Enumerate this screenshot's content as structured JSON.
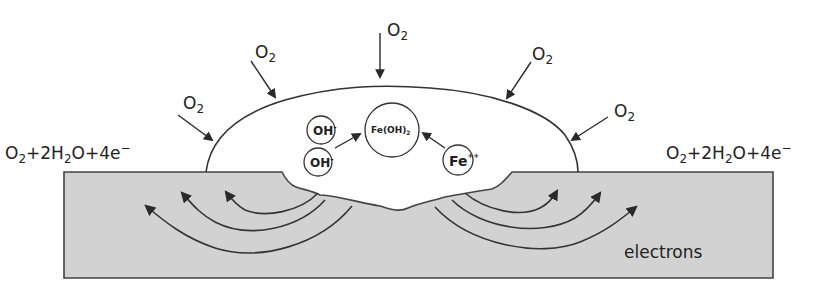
{
  "diagram": {
    "type": "pitting-corrosion-droplet",
    "colors": {
      "background": "#ffffff",
      "metal_fill": "#d2d2d2",
      "stroke": "#333333",
      "text": "#222222"
    },
    "oxygen_labels": [
      {
        "base": "O",
        "sub": "2",
        "x": 183,
        "y": 109
      },
      {
        "base": "O",
        "sub": "2",
        "x": 255,
        "y": 58
      },
      {
        "base": "O",
        "sub": "2",
        "x": 387,
        "y": 36
      },
      {
        "base": "O",
        "sub": "2",
        "x": 532,
        "y": 60
      },
      {
        "base": "O",
        "sub": "2",
        "x": 614,
        "y": 117
      }
    ],
    "cathodic_reaction_left": {
      "parts": [
        "O",
        "2",
        "+2H",
        "2",
        "O+4e",
        "−"
      ]
    },
    "cathodic_reaction_right": {
      "parts": [
        "O",
        "2",
        "+2H",
        "2",
        "O+4e",
        "−"
      ]
    },
    "ions": {
      "oh_1": {
        "label": "OH",
        "charge": "-"
      },
      "oh_2": {
        "label": "OH",
        "charge": "-"
      },
      "fe_oh_2": {
        "label": "Fe(OH)",
        "sub": "2"
      },
      "fe_ion": {
        "label": "Fe",
        "charge": "++"
      }
    },
    "metal_label": "electrons"
  }
}
